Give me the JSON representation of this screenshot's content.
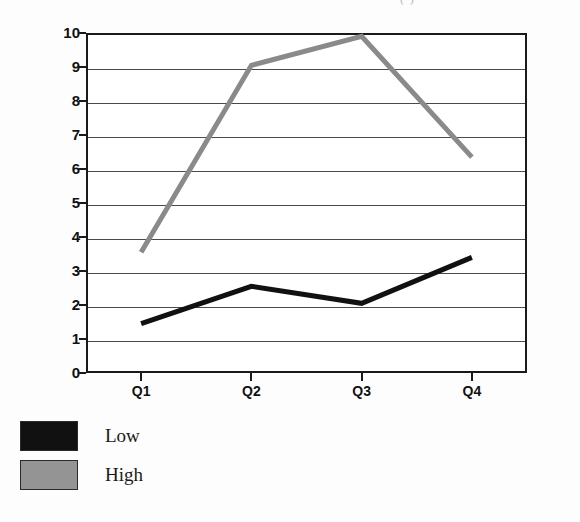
{
  "header": {
    "clipped_text": "(         )"
  },
  "chart_data": {
    "type": "line",
    "title": "",
    "subtitle": "",
    "xlabel": "",
    "ylabel": "",
    "categories": [
      "Q1",
      "Q2",
      "Q3",
      "Q4"
    ],
    "series": [
      {
        "name": "Low",
        "color": "#111111",
        "values": [
          1.45,
          2.55,
          2.05,
          3.4
        ]
      },
      {
        "name": "High",
        "color": "#8a8a8a",
        "values": [
          3.55,
          9.05,
          9.9,
          6.35
        ]
      }
    ],
    "ylim": [
      0,
      10
    ],
    "ytick_labels": [
      "10",
      "9",
      "8",
      "7",
      "6",
      "5",
      "4",
      "3",
      "2",
      "1",
      "0"
    ],
    "ytick_values": [
      10,
      9,
      8,
      7,
      6,
      5,
      4,
      3,
      2,
      1,
      0
    ],
    "grid": true,
    "grid_axis": "y",
    "legend_position": "bottom-left",
    "legend": [
      {
        "label": "Low",
        "color": "#111111"
      },
      {
        "label": "High",
        "color": "#949494"
      }
    ]
  }
}
